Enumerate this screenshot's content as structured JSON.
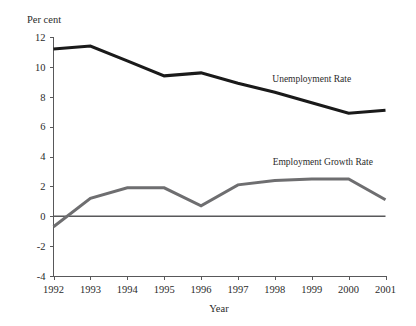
{
  "chart_data": {
    "type": "line",
    "title": "",
    "xlabel": "Year",
    "ylabel": "Per cent",
    "x": [
      1992,
      1993,
      1994,
      1995,
      1996,
      1997,
      1998,
      1999,
      2000,
      2001
    ],
    "categories": [
      "1992",
      "1993",
      "1994",
      "1995",
      "1996",
      "1997",
      "1998",
      "1999",
      "2000",
      "2001"
    ],
    "xlim": [
      1992,
      2001
    ],
    "ylim": [
      -4,
      12
    ],
    "yticks": [
      12,
      10,
      8,
      6,
      4,
      2,
      0,
      -2,
      -4
    ],
    "ytick_labels": [
      "12",
      "10",
      "8",
      "6",
      "4",
      "2",
      "0",
      "-2",
      "-4"
    ],
    "xtick_labels": [
      "1992",
      "1993",
      "1994",
      "1995",
      "1996",
      "1997",
      "1998",
      "1999",
      "2000",
      "2001"
    ],
    "grid": false,
    "legend_position": "inline-annotation",
    "zero_line": 0,
    "series": [
      {
        "name": "Unemployment Rate",
        "color": "#1a1a1a",
        "values": [
          11.2,
          11.4,
          10.4,
          9.4,
          9.6,
          8.9,
          8.3,
          7.6,
          6.9,
          7.1
        ],
        "label_x": 1999.0,
        "label_y": 9.0
      },
      {
        "name": "Employment Growth Rate",
        "color": "#6e6e70",
        "values": [
          -0.7,
          1.2,
          1.9,
          1.9,
          0.7,
          2.1,
          2.4,
          2.5,
          2.5,
          1.1
        ],
        "label_x": 1999.3,
        "label_y": 3.4
      }
    ]
  },
  "axes": {
    "y_axis_title": "Per cent",
    "x_axis_title": "Year"
  }
}
